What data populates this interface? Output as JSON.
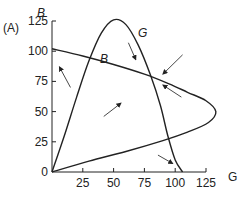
{
  "chart_data": {
    "type": "line",
    "panel_label": "(A)",
    "title": "",
    "xlabel": "G",
    "ylabel": "B",
    "xlim": [
      0,
      125
    ],
    "ylim": [
      0,
      125
    ],
    "xticks": [
      25,
      50,
      75,
      100,
      125
    ],
    "yticks": [
      0,
      25,
      50,
      75,
      100,
      125
    ],
    "x_origin_label": "0",
    "grid": false,
    "legend": "none",
    "series": [
      {
        "name": "G",
        "label": "G",
        "points": [
          [
            0,
            0
          ],
          [
            10,
            30
          ],
          [
            20,
            62
          ],
          [
            30,
            92
          ],
          [
            40,
            115
          ],
          [
            50,
            126
          ],
          [
            60,
            122
          ],
          [
            70,
            105
          ],
          [
            80,
            80
          ],
          [
            88,
            55
          ],
          [
            94,
            30
          ],
          [
            100,
            10
          ],
          [
            106,
            0
          ]
        ]
      },
      {
        "name": "B",
        "label": "B",
        "points": [
          [
            0,
            102
          ],
          [
            25,
            96
          ],
          [
            50,
            89
          ],
          [
            75,
            81
          ],
          [
            95,
            73
          ],
          [
            110,
            66
          ],
          [
            125,
            59
          ],
          [
            133,
            50
          ],
          [
            127,
            41
          ],
          [
            110,
            33
          ],
          [
            90,
            26
          ],
          [
            60,
            17
          ],
          [
            30,
            9
          ],
          [
            0,
            0
          ]
        ]
      }
    ],
    "arrows": [
      {
        "from": [
          15,
          70
        ],
        "to": [
          6,
          87
        ]
      },
      {
        "from": [
          62,
          107
        ],
        "to": [
          68,
          93
        ]
      },
      {
        "from": [
          106,
          97
        ],
        "to": [
          90,
          81
        ]
      },
      {
        "from": [
          105,
          62
        ],
        "to": [
          90,
          72
        ]
      },
      {
        "from": [
          42,
          46
        ],
        "to": [
          56,
          57
        ]
      },
      {
        "from": [
          86,
          14
        ],
        "to": [
          98,
          7
        ]
      }
    ]
  }
}
